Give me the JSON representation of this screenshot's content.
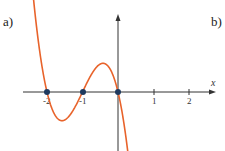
{
  "labels": {
    "a": "a)",
    "b": "b)"
  },
  "chart_data": {
    "type": "line",
    "title": "",
    "xlabel": "x",
    "ylabel": "",
    "x_ticks": [
      "-2",
      "-1",
      "1",
      "2"
    ],
    "function": "f(x) = -2.1 x (x+1)(x+2)",
    "roots": [
      -2,
      -1,
      0
    ],
    "marked_points": [
      {
        "x": -2,
        "y": 0
      },
      {
        "x": -1,
        "y": 0
      },
      {
        "x": 0,
        "y": 0
      }
    ],
    "local_max": {
      "x": -0.42,
      "y": 0.8
    },
    "local_min": {
      "x": -1.58,
      "y": -0.8
    },
    "xlim": [
      -2.7,
      2.8
    ],
    "grid": false,
    "colors": {
      "curve": "#e8632b",
      "points": "#1f3a5f",
      "axes": "#333333"
    }
  }
}
